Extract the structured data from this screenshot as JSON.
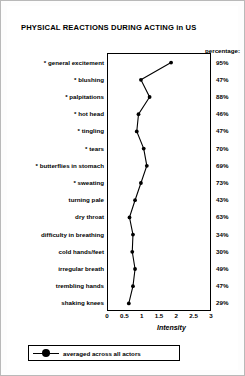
{
  "chart_data": {
    "type": "line",
    "title": "PHYSICAL REACTIONS DURING ACTING in US",
    "xlabel": "Intensity",
    "ylabel": "",
    "orientation": "horizontal-categories",
    "xlim": [
      0,
      3
    ],
    "grid": false,
    "legend_position": "bottom-left",
    "legend": [
      "averaged across all actors"
    ],
    "percentage_header": "percentage:",
    "xticks": [
      "0",
      "0.5",
      "1",
      "1.5",
      "2",
      "2.5",
      "3"
    ],
    "xtick_values": [
      0,
      0.5,
      1,
      1.5,
      2,
      2.5,
      3
    ],
    "categories": [
      "* general excitement",
      "* blushing",
      "* palpitations",
      "* hot head",
      "* tingling",
      "* tears",
      "* butterflies in stomach",
      "* sweating",
      "turning pale",
      "dry throat",
      "difficulty in breathing",
      "cold hands/feet",
      "irregular breath",
      "trembling hands",
      "shaking knees"
    ],
    "values": [
      1.82,
      0.95,
      1.2,
      0.88,
      0.83,
      1.03,
      1.12,
      0.95,
      0.78,
      0.62,
      0.72,
      0.7,
      0.78,
      0.72,
      0.6
    ],
    "percentages": [
      "95%",
      "47%",
      "88%",
      "46%",
      "47%",
      "70%",
      "69%",
      "73%",
      "43%",
      "63%",
      "34%",
      "30%",
      "49%",
      "47%",
      "29%"
    ],
    "series": [
      {
        "name": "averaged across all actors",
        "values": [
          1.82,
          0.95,
          1.2,
          0.88,
          0.83,
          1.03,
          1.12,
          0.95,
          0.78,
          0.62,
          0.72,
          0.7,
          0.78,
          0.72,
          0.6
        ]
      }
    ]
  }
}
